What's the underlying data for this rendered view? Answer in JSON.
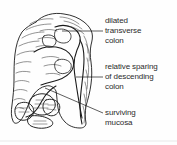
{
  "figure": {
    "background_color": "#fefefe",
    "ink_color": "#1a1a1a",
    "text_color": "#2b2b2b",
    "width": 177,
    "height": 145
  },
  "annotations": [
    {
      "name": "dilated-transverse-colon",
      "lines": [
        "dilated",
        "transverse",
        "colon"
      ],
      "leader": {
        "x1": 62,
        "y1": 31,
        "x2": 103,
        "y2": 31
      }
    },
    {
      "name": "relative-sparing-descending-colon",
      "lines": [
        "relative sparing",
        "of descending",
        "colon"
      ],
      "leader": {
        "x1": 76,
        "y1": 77,
        "x2": 103,
        "y2": 77
      }
    },
    {
      "name": "surviving-mucosa",
      "lines": [
        "surviving",
        "mucosa"
      ],
      "leader": {
        "x1": 45,
        "y1": 88,
        "x2": 103,
        "y2": 113
      }
    }
  ]
}
